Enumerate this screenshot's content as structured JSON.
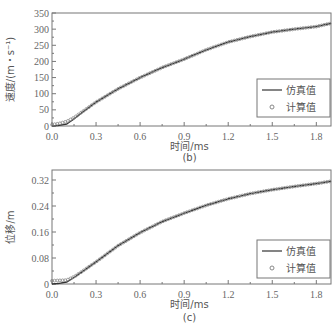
{
  "chart_data": [
    {
      "type": "line",
      "panel_label": "(b)",
      "title": "",
      "xlabel": "时间/ms",
      "ylabel": "速度/(m・s⁻¹)",
      "xlim": [
        0,
        1.9
      ],
      "ylim": [
        0,
        350
      ],
      "xticks": [
        "0.0",
        "0.3",
        "0.6",
        "0.9",
        "1.2",
        "1.5",
        "1.8"
      ],
      "yticks": [
        "0",
        "50",
        "100",
        "150",
        "200",
        "250",
        "300",
        "350"
      ],
      "grid": false,
      "legend_position": "lower right",
      "legend": [
        "仿真值",
        "计算值"
      ],
      "x": [
        0.0,
        0.05,
        0.1,
        0.15,
        0.2,
        0.3,
        0.45,
        0.6,
        0.75,
        0.9,
        1.05,
        1.2,
        1.35,
        1.5,
        1.65,
        1.8,
        1.9
      ],
      "series": [
        {
          "name": "仿真值",
          "style": "line",
          "values": [
            0,
            2,
            6,
            22,
            40,
            74,
            115,
            150,
            181,
            207,
            236,
            260,
            277,
            291,
            300,
            308,
            318
          ]
        },
        {
          "name": "计算值",
          "style": "circle-markers",
          "values": [
            4,
            8,
            14,
            26,
            42,
            74,
            115,
            150,
            181,
            207,
            236,
            260,
            277,
            291,
            300,
            308,
            318
          ]
        }
      ]
    },
    {
      "type": "line",
      "panel_label": "(c)",
      "title": "",
      "xlabel": "时间/ms",
      "ylabel": "位移/m",
      "xlim": [
        0,
        1.9
      ],
      "ylim": [
        0,
        0.34
      ],
      "xticks": [
        "0.0",
        "0.3",
        "0.6",
        "0.9",
        "1.2",
        "1.5",
        "1.8"
      ],
      "yticks": [
        "0",
        "0.08",
        "0.16",
        "0.24",
        "0.32"
      ],
      "grid": false,
      "legend_position": "lower right",
      "legend": [
        "仿真值",
        "计算值"
      ],
      "x": [
        0.0,
        0.05,
        0.1,
        0.15,
        0.2,
        0.3,
        0.45,
        0.6,
        0.75,
        0.9,
        1.05,
        1.2,
        1.35,
        1.5,
        1.65,
        1.8,
        1.9
      ],
      "series": [
        {
          "name": "仿真值",
          "style": "line",
          "values": [
            0,
            0.002,
            0.006,
            0.02,
            0.036,
            0.068,
            0.118,
            0.158,
            0.192,
            0.218,
            0.242,
            0.262,
            0.278,
            0.29,
            0.3,
            0.309,
            0.316
          ]
        },
        {
          "name": "计算值",
          "style": "circle-markers",
          "values": [
            0.01,
            0.011,
            0.012,
            0.022,
            0.037,
            0.068,
            0.118,
            0.158,
            0.192,
            0.218,
            0.242,
            0.262,
            0.278,
            0.29,
            0.3,
            0.309,
            0.316
          ]
        }
      ]
    }
  ],
  "panels": [
    {
      "caption": "(b)",
      "xlabel": "时间/ms",
      "ylabel": "速度/(m・s⁻¹)",
      "legend_line": "仿真值",
      "legend_marker": "计算值"
    },
    {
      "caption": "(c)",
      "xlabel": "时间/ms",
      "ylabel": "位移/m",
      "legend_line": "仿真值",
      "legend_marker": "计算值"
    }
  ],
  "colors": {
    "line": "#333333",
    "marker": "#888888",
    "axis": "#777777",
    "text": "#555555"
  }
}
